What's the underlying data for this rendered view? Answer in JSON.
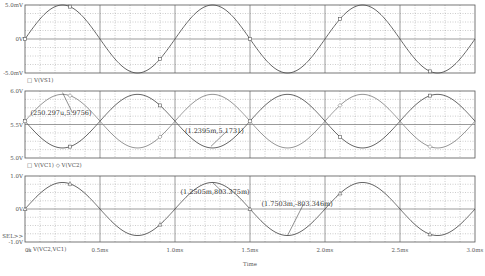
{
  "chart_data": {
    "type": "line",
    "xlabel": "Time",
    "x_ticks": [
      "0s",
      "0.5ms",
      "1.0ms",
      "1.5ms",
      "2.0ms",
      "2.5ms",
      "3.0ms"
    ],
    "xlim": [
      0,
      3.0
    ],
    "x_unit": "ms",
    "grid": true,
    "panels": [
      {
        "name": "top",
        "legend": "□ V(VS1)",
        "y_ticks": [
          "5.0mV",
          "0V",
          "-5.0mV"
        ],
        "ylim": [
          -5.0,
          5.0
        ],
        "y_unit": "mV",
        "series": [
          {
            "name": "V(VS1)",
            "marker": "square",
            "amplitude": 5.0,
            "offset": 0,
            "freq_khz": 1.0,
            "phase_deg": 0
          }
        ]
      },
      {
        "name": "middle",
        "legend": "□ V(VC1)  ◇ V(VC2)",
        "y_ticks": [
          "6.0V",
          "5.5V",
          "5.0V"
        ],
        "ylim": [
          5.0,
          6.0
        ],
        "y_unit": "V",
        "series": [
          {
            "name": "V(VC1)",
            "marker": "square",
            "amplitude": 0.4,
            "offset": 5.55,
            "freq_khz": 1.0,
            "phase_deg": 180
          },
          {
            "name": "V(VC2)",
            "marker": "diamond",
            "amplitude": 0.4,
            "offset": 5.55,
            "freq_khz": 1.0,
            "phase_deg": 0
          }
        ],
        "annotations": [
          {
            "text": "(250.297u,5.9756)",
            "x_ms": 0.2503,
            "y": 5.9756
          },
          {
            "text": "(1.2395m,5.1731)",
            "x_ms": 1.2395,
            "y": 5.1731
          }
        ]
      },
      {
        "name": "bottom",
        "legend": "△ V(VC2,VC1)",
        "y_ticks": [
          "1.0V",
          "0V",
          "-1.0V"
        ],
        "y_extra_label": "SEL>>",
        "ylim": [
          -1.0,
          1.0
        ],
        "y_unit": "V",
        "series": [
          {
            "name": "V(VC2,VC1)",
            "marker": "triangle",
            "amplitude": 0.8034,
            "offset": 0,
            "freq_khz": 1.0,
            "phase_deg": 0
          }
        ],
        "annotations": [
          {
            "text": "(1.2505m,803.375m)",
            "x_ms": 1.2505,
            "y": 0.803375
          },
          {
            "text": "(1.7503m,-803.346m)",
            "x_ms": 1.7503,
            "y": -0.803346
          }
        ]
      }
    ]
  }
}
